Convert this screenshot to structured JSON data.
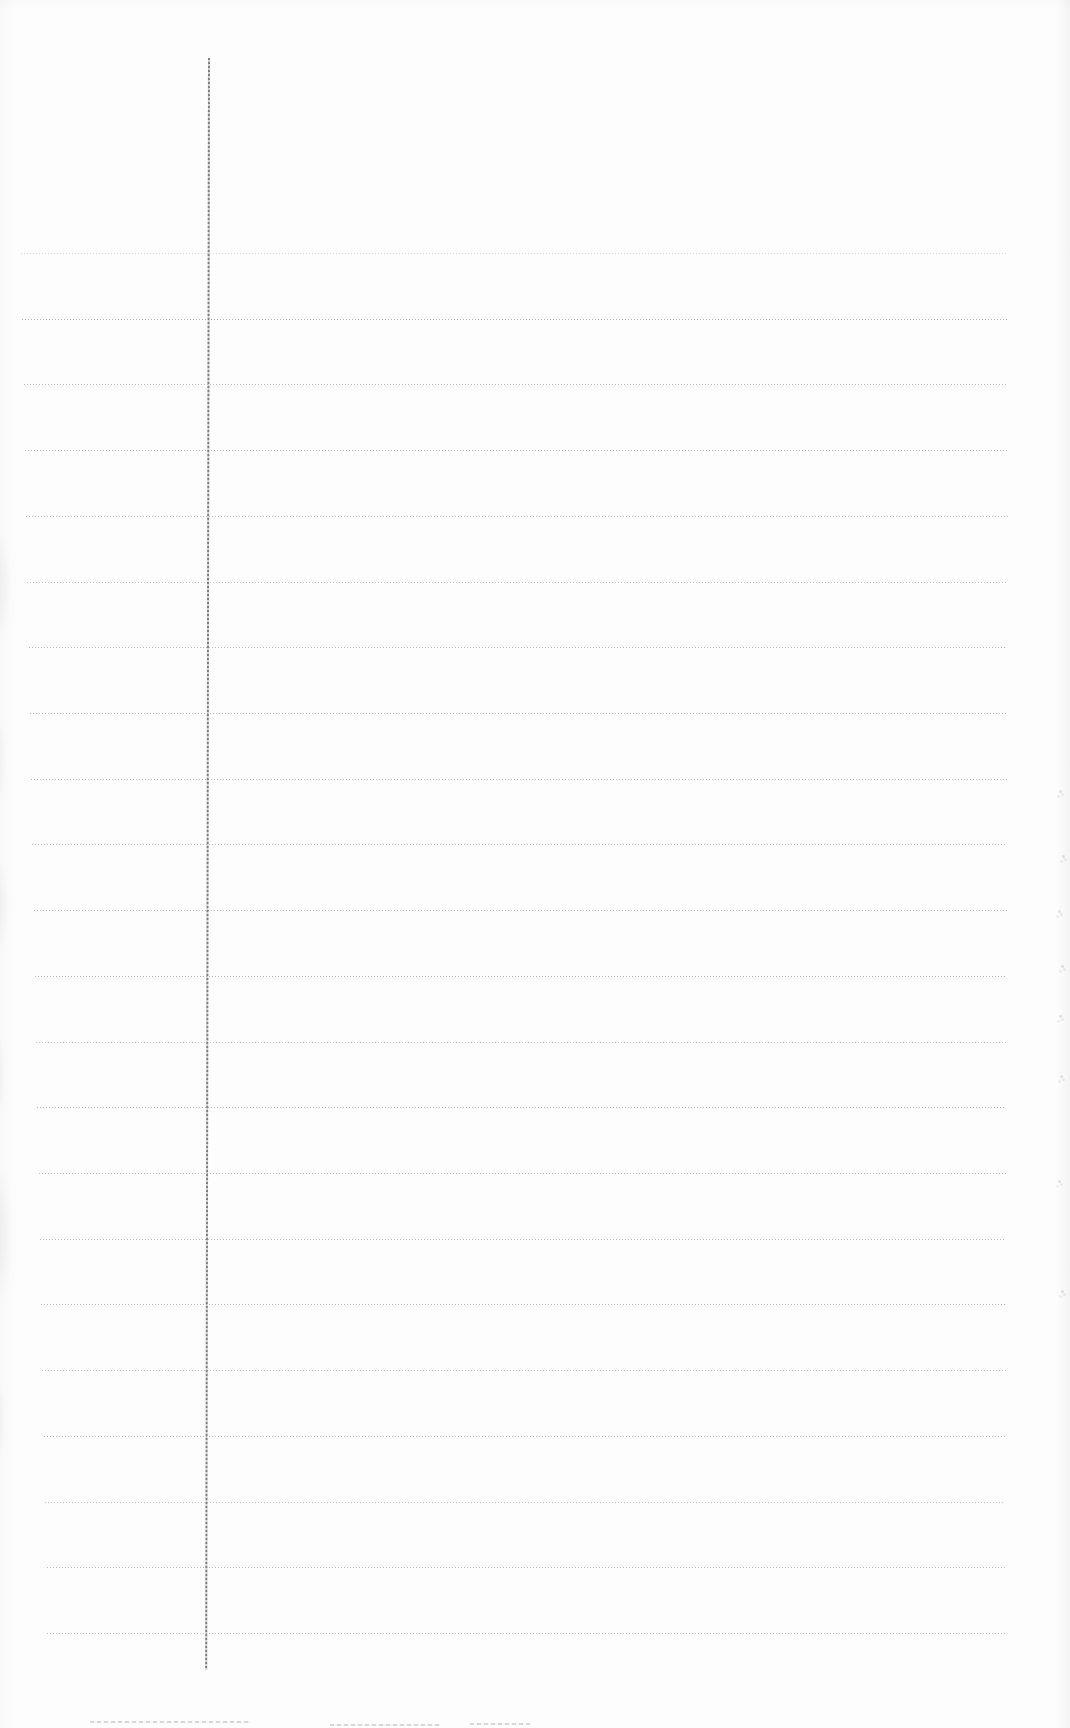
{
  "page": {
    "width": 1070,
    "height": 1728,
    "background_color": "#fdfdfd"
  },
  "ruling": {
    "line_color": "#9e9e9e",
    "line_style": "dotted",
    "lines": [
      {
        "y": 253,
        "x1": 21,
        "x2": 1008,
        "opacity": 0.35
      },
      {
        "y": 319,
        "x1": 22,
        "x2": 1008,
        "opacity": 0.75
      },
      {
        "y": 384,
        "x1": 24,
        "x2": 1008,
        "opacity": 0.65
      },
      {
        "y": 450,
        "x1": 25,
        "x2": 1008,
        "opacity": 0.72
      },
      {
        "y": 516,
        "x1": 26,
        "x2": 1008,
        "opacity": 0.62
      },
      {
        "y": 582,
        "x1": 27,
        "x2": 1008,
        "opacity": 0.55
      },
      {
        "y": 647,
        "x1": 29,
        "x2": 1007,
        "opacity": 0.72
      },
      {
        "y": 713,
        "x1": 30,
        "x2": 1007,
        "opacity": 0.66
      },
      {
        "y": 779,
        "x1": 31,
        "x2": 1007,
        "opacity": 0.7
      },
      {
        "y": 844,
        "x1": 32,
        "x2": 1007,
        "opacity": 0.64
      },
      {
        "y": 910,
        "x1": 34,
        "x2": 1007,
        "opacity": 0.58
      },
      {
        "y": 976,
        "x1": 35,
        "x2": 1007,
        "opacity": 0.7
      },
      {
        "y": 1042,
        "x1": 36,
        "x2": 1006,
        "opacity": 0.52
      },
      {
        "y": 1107,
        "x1": 37,
        "x2": 1006,
        "opacity": 0.72
      },
      {
        "y": 1173,
        "x1": 39,
        "x2": 1006,
        "opacity": 0.6
      },
      {
        "y": 1239,
        "x1": 40,
        "x2": 1006,
        "opacity": 0.68
      },
      {
        "y": 1304,
        "x1": 41,
        "x2": 1006,
        "opacity": 0.72
      },
      {
        "y": 1370,
        "x1": 42,
        "x2": 1006,
        "opacity": 0.55
      },
      {
        "y": 1436,
        "x1": 44,
        "x2": 1006,
        "opacity": 0.7
      },
      {
        "y": 1502,
        "x1": 45,
        "x2": 1005,
        "opacity": 0.52
      },
      {
        "y": 1567,
        "x1": 47,
        "x2": 1005,
        "opacity": 0.68
      },
      {
        "y": 1633,
        "x1": 47,
        "x2": 1005,
        "opacity": 0.62
      }
    ],
    "margin_line": {
      "x": 208,
      "y1": 58,
      "y2": 1670,
      "width": 2,
      "color": "#7f7f7f",
      "tilt_deg": 0.1
    }
  },
  "artifacts": {
    "left_edge_shadows": [
      {
        "cx": -4,
        "cy": 585,
        "rx": 16,
        "ry": 58
      },
      {
        "cx": -5,
        "cy": 760,
        "rx": 12,
        "ry": 48
      },
      {
        "cx": -4,
        "cy": 905,
        "rx": 13,
        "ry": 52
      },
      {
        "cx": -5,
        "cy": 1075,
        "rx": 11,
        "ry": 46
      },
      {
        "cx": -3,
        "cy": 1235,
        "rx": 17,
        "ry": 72
      },
      {
        "cx": -5,
        "cy": 1420,
        "rx": 11,
        "ry": 42
      }
    ],
    "right_edge_specks": [
      {
        "x": 1059,
        "y": 790
      },
      {
        "x": 1062,
        "y": 855
      },
      {
        "x": 1058,
        "y": 910
      },
      {
        "x": 1061,
        "y": 965
      },
      {
        "x": 1059,
        "y": 1015
      },
      {
        "x": 1060,
        "y": 1075
      },
      {
        "x": 1058,
        "y": 1180
      },
      {
        "x": 1061,
        "y": 1290
      }
    ],
    "bottom_smudges": [
      {
        "x": 90,
        "y": 1721,
        "w": 160
      },
      {
        "x": 330,
        "y": 1724,
        "w": 110
      },
      {
        "x": 470,
        "y": 1723,
        "w": 60
      }
    ]
  }
}
